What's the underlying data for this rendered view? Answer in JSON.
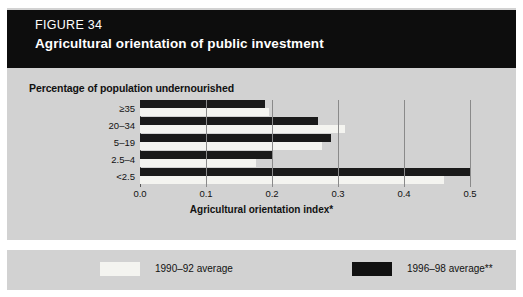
{
  "header": {
    "figure_number": "FIGURE 34",
    "title": "Agricultural orientation of public investment"
  },
  "colors": {
    "header_band": "#0d0d0d",
    "card_background": "#d2d2d2",
    "series_1990_92": "#f4f4f0",
    "series_1996_98": "#111111",
    "gridline": "#8a8a8a",
    "axis": "#5a5a5a"
  },
  "chart_data": {
    "type": "bar",
    "orientation": "horizontal",
    "title": "Agricultural orientation of public investment",
    "subtitle": "Percentage of population undernourished",
    "xlabel": "Agricultural orientation index*",
    "ylabel": "Percentage of population undernourished",
    "categories": [
      "≥35",
      "20–34",
      "5–19",
      "2.5–4",
      "<2.5"
    ],
    "series": [
      {
        "name": "1990–92 average",
        "color": "#f4f4f0",
        "values": [
          0.195,
          0.31,
          0.275,
          0.175,
          0.46
        ]
      },
      {
        "name": "1996–98 average**",
        "color": "#111111",
        "values": [
          0.19,
          0.27,
          0.29,
          0.2,
          0.5
        ]
      }
    ],
    "xlim": [
      0.0,
      0.5
    ],
    "xticks": [
      0.0,
      0.1,
      0.2,
      0.3,
      0.4,
      0.5
    ],
    "xtick_labels": [
      "0.0",
      "0.1",
      "0.2",
      "0.3",
      "0.4",
      "0.5"
    ],
    "grid": "vertical",
    "legend_position": "bottom"
  },
  "legend": {
    "items": [
      {
        "label": "1990–92 average",
        "color": "#f4f4f0"
      },
      {
        "label": "1996–98 average**",
        "color": "#111111"
      }
    ]
  }
}
